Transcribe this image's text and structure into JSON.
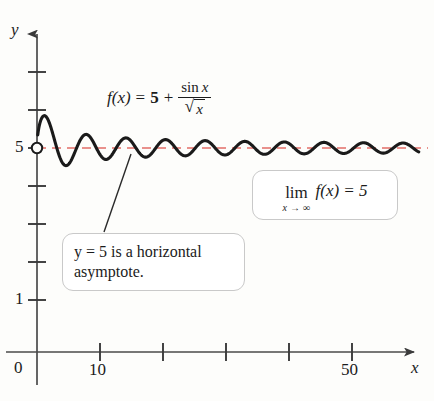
{
  "figure": {
    "name": "horizontal-asymptote-graph",
    "background_color": "#fdfdfb"
  },
  "axes": {
    "y_axis_label": "y",
    "x_axis_label": "x",
    "origin_label": "0",
    "y_tick_labels": [
      {
        "value": 5,
        "text": "5"
      },
      {
        "value": 1,
        "text": "1"
      }
    ],
    "x_tick_labels": [
      {
        "value": 10,
        "text": "10"
      },
      {
        "value": 50,
        "text": "50"
      }
    ],
    "y_ticks_values": [
      1,
      2,
      3,
      4,
      5,
      6,
      7
    ],
    "x_ticks_values": [
      10,
      20,
      30,
      40,
      50
    ],
    "axis_color": "#4a4a4a"
  },
  "formula": {
    "lhs": "f(x)",
    "equals": "=",
    "constant": "5",
    "plus": "+",
    "numerator_fn": "sin",
    "numerator_var": "x",
    "sqrt_symbol": "√",
    "denominator_var": "x",
    "plain_text": "f(x) = 5 + sin x / √x"
  },
  "limit_callout": {
    "lim_text": "lim",
    "subscript": "x → ∞",
    "body": "f(x) = 5",
    "plain_text": "lim (x→∞) f(x) = 5"
  },
  "asymptote_callout": {
    "line1": "y = 5 is a horizontal",
    "line2": "asymptote.",
    "plain_text": "y = 5 is a horizontal asymptote."
  },
  "asymptote_line": {
    "y_value": 5,
    "color": "#e9918c",
    "style": "dashed"
  },
  "curve": {
    "color": "#1a1a1a",
    "start_point_marker": "open-circle",
    "start_point_x": 0,
    "start_point_y": 5
  },
  "chart_data": {
    "type": "line",
    "title": "",
    "xlabel": "x",
    "ylabel": "y",
    "xlim": [
      0,
      61
    ],
    "ylim": [
      0,
      7.6
    ],
    "grid": false,
    "legend": "none",
    "function_expression": "f(x) = 5 + sin(x)/sqrt(x)",
    "asymptote": {
      "type": "horizontal",
      "y": 5,
      "label": "y = 5 is a horizontal asymptote."
    },
    "annotations": [
      "f(x) = 5 + sin x / √x",
      "lim (x→∞) f(x) = 5",
      "y = 5 is a horizontal asymptote."
    ],
    "x_ticks": [
      0,
      10,
      20,
      30,
      40,
      50
    ],
    "x_tick_labels_shown": [
      "0",
      "10",
      "50"
    ],
    "y_ticks": [
      1,
      2,
      3,
      4,
      5,
      6,
      7
    ],
    "y_tick_labels_shown": [
      "1",
      "5"
    ],
    "series": [
      {
        "name": "f(x) = 5 + sin x / sqrt(x)",
        "x": [
          0.15,
          0.5,
          1,
          1.57,
          2,
          3,
          4,
          4.71,
          5.5,
          6.28,
          7,
          7.85,
          9,
          10,
          11,
          12,
          13,
          14,
          14.14,
          15,
          16,
          17,
          17.28,
          18,
          19,
          20,
          20.42,
          21,
          22,
          23,
          23.56,
          24,
          25,
          26,
          26.7,
          28,
          29,
          29.85,
          31,
          32,
          33,
          33,
          35,
          36,
          36.13,
          38,
          39,
          39.27,
          41,
          42,
          42.4,
          44,
          45,
          45.55,
          47,
          48,
          48.69,
          50,
          51,
          51.8,
          53,
          54,
          54.98,
          56,
          57,
          58.1,
          59,
          60
        ],
        "y": [
          5.39,
          5.68,
          5.84,
          5.8,
          5.64,
          5.08,
          4.62,
          4.54,
          4.7,
          5.0,
          5.25,
          5.36,
          5.14,
          4.83,
          4.7,
          4.85,
          5.12,
          5.26,
          5.27,
          5.17,
          4.93,
          4.77,
          4.76,
          4.82,
          5.04,
          5.2,
          5.22,
          5.18,
          5.0,
          4.82,
          4.79,
          4.82,
          5.0,
          5.18,
          5.19,
          4.93,
          4.82,
          4.82,
          5.05,
          5.17,
          5.15,
          5.15,
          4.85,
          4.83,
          4.83,
          5.1,
          5.16,
          5.16,
          4.97,
          4.85,
          4.85,
          5.04,
          5.15,
          5.15,
          5.0,
          4.87,
          4.85,
          5.05,
          5.14,
          5.14,
          4.96,
          4.87,
          4.87,
          5.06,
          5.13,
          5.13,
          5.02,
          4.89
        ]
      }
    ]
  }
}
